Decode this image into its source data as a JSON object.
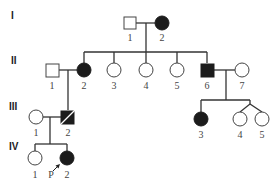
{
  "diagram": {
    "type": "pedigree",
    "colors": {
      "affected": "#1c1c1c",
      "unaffected": "#ffffff",
      "line": "#333333"
    },
    "generations": [
      {
        "label": "I",
        "y": 23
      },
      {
        "label": "II",
        "y": 70
      },
      {
        "label": "III",
        "y": 117
      },
      {
        "label": "IV",
        "y": 158
      }
    ],
    "individuals": [
      {
        "id": "I-1",
        "number": "1",
        "sex": "male",
        "affected": false,
        "deceased": false,
        "x": 130,
        "y": 23
      },
      {
        "id": "I-2",
        "number": "2",
        "sex": "female",
        "affected": true,
        "deceased": false,
        "x": 162,
        "y": 23
      },
      {
        "id": "II-1",
        "number": "1",
        "sex": "male",
        "affected": false,
        "deceased": false,
        "x": 52,
        "y": 70
      },
      {
        "id": "II-2",
        "number": "2",
        "sex": "female",
        "affected": true,
        "deceased": false,
        "x": 84,
        "y": 70
      },
      {
        "id": "II-3",
        "number": "3",
        "sex": "female",
        "affected": false,
        "deceased": false,
        "x": 114,
        "y": 70
      },
      {
        "id": "II-4",
        "number": "4",
        "sex": "female",
        "affected": false,
        "deceased": false,
        "x": 146,
        "y": 70
      },
      {
        "id": "II-5",
        "number": "5",
        "sex": "female",
        "affected": false,
        "deceased": false,
        "x": 177,
        "y": 70
      },
      {
        "id": "II-6",
        "number": "6",
        "sex": "male",
        "affected": true,
        "deceased": false,
        "x": 207,
        "y": 70
      },
      {
        "id": "II-7",
        "number": "7",
        "sex": "female",
        "affected": false,
        "deceased": false,
        "x": 242,
        "y": 70
      },
      {
        "id": "III-1",
        "number": "1",
        "sex": "female",
        "affected": false,
        "deceased": false,
        "x": 36,
        "y": 117
      },
      {
        "id": "III-2",
        "number": "2",
        "sex": "male",
        "affected": true,
        "deceased": true,
        "x": 68,
        "y": 117
      },
      {
        "id": "III-3",
        "number": "3",
        "sex": "female",
        "affected": true,
        "deceased": false,
        "x": 201,
        "y": 119
      },
      {
        "id": "III-4",
        "number": "4",
        "sex": "female",
        "affected": false,
        "deceased": false,
        "x": 240,
        "y": 119
      },
      {
        "id": "III-5",
        "number": "5",
        "sex": "female",
        "affected": false,
        "deceased": false,
        "x": 262,
        "y": 119
      },
      {
        "id": "IV-1",
        "number": "1",
        "sex": "female",
        "affected": false,
        "deceased": false,
        "x": 35,
        "y": 158
      },
      {
        "id": "IV-2",
        "number": "2",
        "sex": "female",
        "affected": true,
        "deceased": false,
        "x": 67,
        "y": 158
      }
    ],
    "proband": {
      "id": "IV-2",
      "label": "P"
    },
    "twins": [
      "III-4",
      "III-5"
    ]
  }
}
